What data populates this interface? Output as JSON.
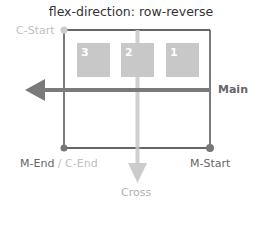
{
  "title": "flex-direction: row-reverse",
  "labels": {
    "c_start": "C-Start",
    "main": "Main",
    "m_end": "M-End",
    "separator": " / ",
    "c_end": "C-End",
    "m_start": "M-Start",
    "cross": "Cross"
  },
  "items": [
    {
      "label": "3"
    },
    {
      "label": "2"
    },
    {
      "label": "1"
    }
  ],
  "colors": {
    "container_border": "#333333",
    "item_fill": "#c8c8c8",
    "main_arrow": "#7a7a7a",
    "cross_arrow": "#cccccc",
    "muted_label": "#c0c0c0",
    "label": "#666666"
  }
}
